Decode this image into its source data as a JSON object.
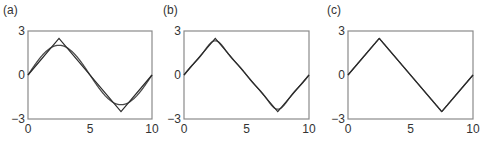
{
  "chart_data": [
    {
      "type": "line",
      "panel_label": "(a)",
      "title": "",
      "xlabel": "",
      "ylabel": "",
      "xlim": [
        0,
        10
      ],
      "ylim": [
        -3,
        3
      ],
      "xticks": [
        "0",
        "5",
        "10"
      ],
      "yticks": [
        "3",
        "0",
        "−3"
      ],
      "grid": false,
      "series": [
        {
          "name": "triangle wave",
          "x": [
            0,
            2.5,
            7.5,
            10
          ],
          "y": [
            0,
            2.5,
            -2.5,
            0
          ]
        },
        {
          "name": "approximation (1 term)",
          "terms": 1,
          "amplitude": 2.5,
          "period": 10
        }
      ]
    },
    {
      "type": "line",
      "panel_label": "(b)",
      "title": "",
      "xlabel": "",
      "ylabel": "",
      "xlim": [
        0,
        10
      ],
      "ylim": [
        -3,
        3
      ],
      "xticks": [
        "0",
        "5",
        "10"
      ],
      "yticks": [
        "3",
        "0",
        "−3"
      ],
      "grid": false,
      "series": [
        {
          "name": "triangle wave",
          "x": [
            0,
            2.5,
            7.5,
            10
          ],
          "y": [
            0,
            2.5,
            -2.5,
            0
          ]
        },
        {
          "name": "approximation (3 terms)",
          "terms": 3,
          "amplitude": 2.5,
          "period": 10
        }
      ]
    },
    {
      "type": "line",
      "panel_label": "(c)",
      "title": "",
      "xlabel": "",
      "ylabel": "",
      "xlim": [
        0,
        10
      ],
      "ylim": [
        -3,
        3
      ],
      "xticks": [
        "0",
        "5",
        "10"
      ],
      "yticks": [
        "3",
        "0",
        "−3"
      ],
      "grid": false,
      "series": [
        {
          "name": "triangle wave",
          "x": [
            0,
            2.5,
            7.5,
            10
          ],
          "y": [
            0,
            2.5,
            -2.5,
            0
          ]
        },
        {
          "name": "approximation (many terms)",
          "terms": 25,
          "amplitude": 2.5,
          "period": 10
        }
      ]
    }
  ],
  "layout": {
    "frames": [
      {
        "left": 28,
        "right": 152,
        "top": 31,
        "bottom": 119
      },
      {
        "left": 184,
        "right": 309,
        "top": 31,
        "bottom": 119
      },
      {
        "left": 348,
        "right": 473,
        "top": 31,
        "bottom": 119
      }
    ],
    "colors": {
      "frame": "#8a8a8a",
      "line": "#2a2a2a",
      "approx": "#4a4a4a"
    }
  }
}
